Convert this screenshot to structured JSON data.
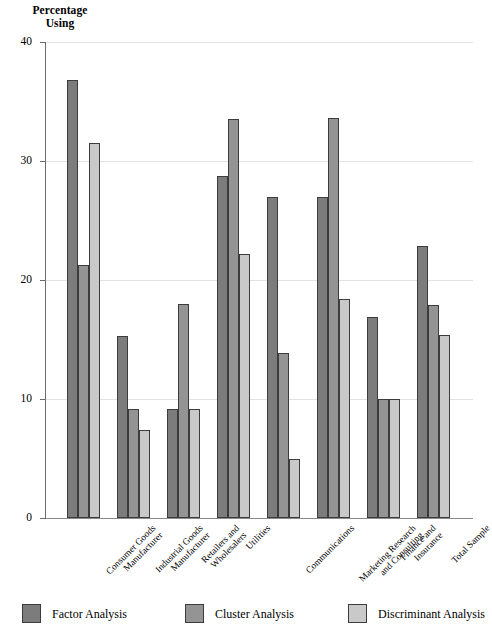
{
  "chart_data": {
    "type": "bar",
    "title": "Percentage Using",
    "xlabel": "",
    "ylabel": "Percentage Using",
    "ylim": [
      0,
      40
    ],
    "yticks": [
      0,
      10,
      20,
      30,
      40
    ],
    "grid": true,
    "legend_position": "bottom",
    "categories": [
      "Consumer Goods Manufacturer",
      "Industrial Goods Manufacturer",
      "Retailers and Wholesalers",
      "Utilities",
      "Communications",
      "Marketing Research and Consulting",
      "Finance and Insurance",
      "Total Sample"
    ],
    "series": [
      {
        "name": "Factor Analysis",
        "color": "#7c7c7c",
        "values": [
          36.8,
          15.3,
          9.2,
          28.7,
          27.0,
          27.0,
          16.9,
          22.9
        ]
      },
      {
        "name": "Cluster Analysis",
        "color": "#949494",
        "values": [
          21.3,
          9.2,
          18.0,
          33.5,
          13.9,
          33.6,
          10.0,
          17.9
        ]
      },
      {
        "name": "Discriminant Analysis",
        "color": "#c9c9c9",
        "values": [
          31.5,
          7.4,
          9.2,
          22.2,
          5.0,
          18.4,
          10.0,
          15.4
        ]
      }
    ]
  },
  "axis": {
    "y_tick_labels": [
      "40",
      "30",
      "20",
      "10",
      "0"
    ]
  },
  "title": {
    "line1": "Percentage",
    "line2": "Using"
  }
}
